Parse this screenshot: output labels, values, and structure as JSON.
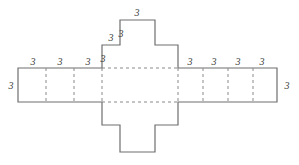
{
  "figure": {
    "stroke_color": "#6e6e6e",
    "dashed_color": "#8a8a8a",
    "label_color": "#3a3a3a",
    "background": "#ffffff",
    "canvas": {
      "width": 299,
      "height": 165
    },
    "outline_points": "18,68 102,68 102,45 120,45 120,20 155,20 155,45 178,45 178,68 277,68 277,102 178,102 178,125 155,125 155,152 120,152 120,125 102,125 102,102 18,102",
    "dashed_segments": [
      {
        "name": "center-top-edge",
        "x1": 102,
        "y1": 68,
        "x2": 178,
        "y2": 68
      },
      {
        "name": "center-bottom-edge",
        "x1": 102,
        "y1": 102,
        "x2": 178,
        "y2": 102
      },
      {
        "name": "center-left-edge",
        "x1": 102,
        "y1": 68,
        "x2": 102,
        "y2": 102
      },
      {
        "name": "center-right-edge",
        "x1": 178,
        "y1": 68,
        "x2": 178,
        "y2": 102
      },
      {
        "name": "left-arm-divider-1",
        "x1": 46,
        "y1": 68,
        "x2": 46,
        "y2": 102
      },
      {
        "name": "left-arm-divider-2",
        "x1": 74,
        "y1": 68,
        "x2": 74,
        "y2": 102
      },
      {
        "name": "right-arm-divider-1",
        "x1": 203,
        "y1": 68,
        "x2": 203,
        "y2": 102
      },
      {
        "name": "right-arm-divider-2",
        "x1": 228,
        "y1": 68,
        "x2": 228,
        "y2": 102
      },
      {
        "name": "right-arm-divider-3",
        "x1": 253,
        "y1": 68,
        "x2": 253,
        "y2": 102
      }
    ],
    "labels": [
      {
        "name": "label-left-arm-seg1-top",
        "text": "3",
        "x": 33,
        "y": 62
      },
      {
        "name": "label-left-arm-seg2-top",
        "text": "3",
        "x": 60,
        "y": 62
      },
      {
        "name": "label-left-arm-seg3-top",
        "text": "3",
        "x": 88,
        "y": 62
      },
      {
        "name": "label-left-arm-end",
        "text": "3",
        "x": 11,
        "y": 86
      },
      {
        "name": "label-step-lower-left",
        "text": "3",
        "x": 103,
        "y": 59
      },
      {
        "name": "label-step-upper-left",
        "text": "3",
        "x": 111,
        "y": 38
      },
      {
        "name": "label-step-riser-left",
        "text": "3",
        "x": 121,
        "y": 34
      },
      {
        "name": "label-top-arm-top",
        "text": "3",
        "x": 137,
        "y": 13
      },
      {
        "name": "label-right-arm-seg1-top",
        "text": "3",
        "x": 190,
        "y": 62
      },
      {
        "name": "label-right-arm-seg2-top",
        "text": "3",
        "x": 214,
        "y": 62
      },
      {
        "name": "label-right-arm-seg3-top",
        "text": "3",
        "x": 238,
        "y": 62
      },
      {
        "name": "label-right-arm-seg4-top",
        "text": "3",
        "x": 262,
        "y": 62
      },
      {
        "name": "label-right-arm-end",
        "text": "3",
        "x": 287,
        "y": 86
      }
    ]
  }
}
